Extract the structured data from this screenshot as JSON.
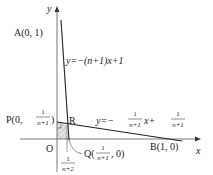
{
  "axes": {
    "x_label": "x",
    "y_label": "y",
    "origin_label": "O"
  },
  "points": {
    "A": {
      "label": "A(0, 1)"
    },
    "B": {
      "label": "B(1, 0)"
    },
    "R": {
      "label": "R"
    },
    "P": {
      "prefix": "P(0, ",
      "frac_num": "1",
      "frac_den": "n+1",
      "suffix": ")"
    },
    "Q": {
      "prefix": "Q(",
      "frac_num": "1",
      "frac_den": "n+1",
      "suffix": ", 0)"
    }
  },
  "lines": {
    "line1": {
      "label": "y=−(n+1)x+1"
    },
    "line2": {
      "lhs": "y=−",
      "frac1_num": "1",
      "frac1_den": "n+1",
      "mid": "x+",
      "frac2_num": "1",
      "frac2_den": "n+1"
    }
  },
  "tick": {
    "frac_num": "1",
    "frac_den": "n+2"
  },
  "colors": {
    "axis": "#555555",
    "line": "#222222",
    "shade": "#d9d9d9"
  }
}
